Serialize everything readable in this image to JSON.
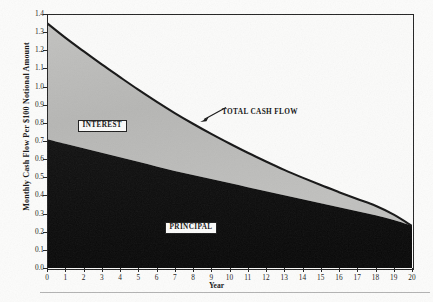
{
  "chart_data": {
    "type": "area",
    "title": "",
    "xlabel": "Year",
    "ylabel": "Monthly Cash Flow Per $100 Notional Amount",
    "xlim": [
      0,
      20
    ],
    "ylim": [
      0.0,
      1.4
    ],
    "grid": false,
    "stacked": true,
    "legend_position": "inline-annotations",
    "xtick_labels": [
      "0",
      "1",
      "2",
      "3",
      "4",
      "5",
      "6",
      "7",
      "8",
      "9",
      "10",
      "11",
      "12",
      "13",
      "14",
      "15",
      "16",
      "17",
      "18",
      "19",
      "20"
    ],
    "ytick_labels": [
      "0.0",
      "0.1",
      "0.2",
      "0.3",
      "0.4",
      "0.5",
      "0.6",
      "0.7",
      "0.8",
      "0.9",
      "1.0",
      "1.1",
      "1.2",
      "1.3",
      "1.4"
    ],
    "x": [
      0,
      1,
      2,
      3,
      4,
      5,
      6,
      7,
      8,
      9,
      10,
      11,
      12,
      13,
      14,
      15,
      16,
      17,
      18,
      19,
      20
    ],
    "series": [
      {
        "name": "PRINCIPAL",
        "color": "#0c0c0c",
        "values": [
          0.71,
          0.685,
          0.66,
          0.635,
          0.61,
          0.585,
          0.56,
          0.535,
          0.512,
          0.49,
          0.468,
          0.445,
          0.423,
          0.401,
          0.379,
          0.357,
          0.335,
          0.313,
          0.291,
          0.264,
          0.232
        ]
      },
      {
        "name": "INTEREST",
        "color": "#b9b9b7",
        "values": [
          0.64,
          0.585,
          0.535,
          0.487,
          0.442,
          0.398,
          0.357,
          0.319,
          0.283,
          0.249,
          0.218,
          0.19,
          0.164,
          0.14,
          0.119,
          0.1,
          0.083,
          0.067,
          0.052,
          0.03,
          0.0
        ]
      }
    ],
    "total": {
      "name": "TOTAL CASH FLOW",
      "color": "#141414",
      "values": [
        1.35,
        1.27,
        1.195,
        1.122,
        1.052,
        0.983,
        0.917,
        0.854,
        0.795,
        0.739,
        0.686,
        0.635,
        0.587,
        0.541,
        0.498,
        0.457,
        0.418,
        0.38,
        0.343,
        0.294,
        0.232
      ]
    },
    "annotations": [
      {
        "id": "total-cash-flow",
        "text": "TOTAL CASH FLOW",
        "points_to_x": 7.1,
        "points_to_y": 0.8
      },
      {
        "id": "interest-label",
        "text": "INTEREST",
        "at_x": 2.6,
        "at_y": 0.82
      },
      {
        "id": "principal-label",
        "text": "PRINCIPAL",
        "at_x": 9.5,
        "at_y": 0.27
      }
    ]
  },
  "axes": {
    "y_title": "Monthly Cash Flow Per $100 Notional Amount",
    "x_title": "Year"
  },
  "labels": {
    "interest": "INTEREST",
    "principal": "PRINCIPAL",
    "total_cash_flow": "TOTAL CASH FLOW"
  },
  "colors": {
    "principal_fill": "#0c0c0c",
    "interest_fill": "#b9b9b7",
    "curve_stroke": "#141414",
    "frame": "#232323",
    "page_background": "#fcfcfb"
  }
}
